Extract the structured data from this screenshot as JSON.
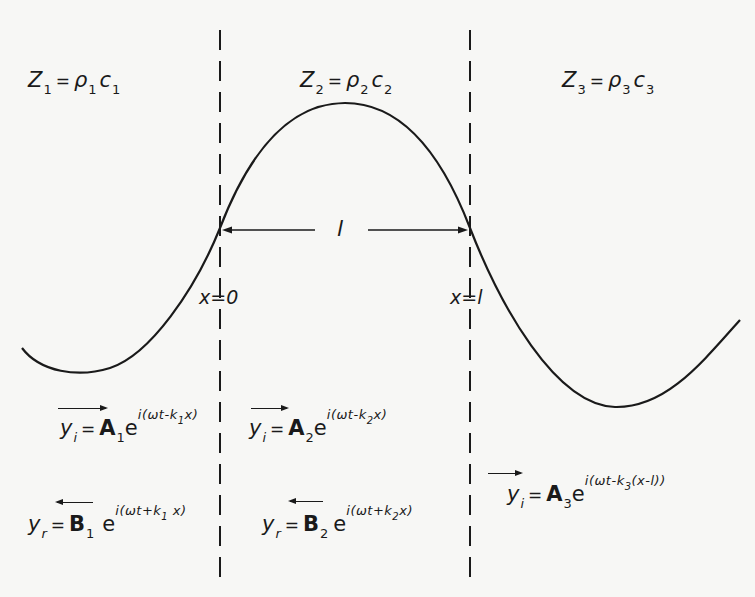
{
  "diagram": {
    "title": "",
    "regions": [
      {
        "id": "medium-1",
        "impedance_symbol": "Z",
        "index": "1",
        "equals": "=",
        "density": "ρ",
        "speed": "c"
      },
      {
        "id": "medium-2",
        "impedance_symbol": "Z",
        "index": "2",
        "equals": "=",
        "density": "ρ",
        "speed": "c"
      },
      {
        "id": "medium-3",
        "impedance_symbol": "Z",
        "index": "3",
        "equals": "=",
        "density": "ρ",
        "speed": "c"
      }
    ],
    "boundaries": [
      {
        "label": "x=0",
        "x_px": 220
      },
      {
        "label": "x=l",
        "x_px": 470
      }
    ],
    "length_label": "l",
    "waves": [
      {
        "id": "incident-1",
        "direction": "right",
        "y": "y",
        "y_sub": "i",
        "amp": "A",
        "amp_sub": "1",
        "base": "e",
        "exp_pre": "i(ωt-k",
        "exp_sub": "1",
        "exp_post": "x)"
      },
      {
        "id": "reflected-1",
        "direction": "left",
        "y": "y",
        "y_sub": "r",
        "amp": "B",
        "amp_sub": "1",
        "base": "e",
        "exp_pre": "i(ωt+k",
        "exp_sub": "1",
        "exp_post": " x)"
      },
      {
        "id": "incident-2",
        "direction": "right",
        "y": "y",
        "y_sub": "i",
        "amp": "A",
        "amp_sub": "2",
        "base": "e",
        "exp_pre": "i(ωt-k",
        "exp_sub": "2",
        "exp_post": "x)"
      },
      {
        "id": "reflected-2",
        "direction": "left",
        "y": "y",
        "y_sub": "r",
        "amp": "B",
        "amp_sub": "2",
        "base": "e",
        "exp_pre": "i(ωt+k",
        "exp_sub": "2",
        "exp_post": "x)"
      },
      {
        "id": "transmitted-3",
        "direction": "right",
        "y": "y",
        "y_sub": "i",
        "amp": "A",
        "amp_sub": "3",
        "base": "e",
        "exp_pre": "i(ωt-k",
        "exp_sub": "3",
        "exp_post": "(x-l))"
      }
    ],
    "equals": "=",
    "colors": {
      "ink": "#1a1a1a",
      "paper": "#f7f7f5"
    }
  }
}
